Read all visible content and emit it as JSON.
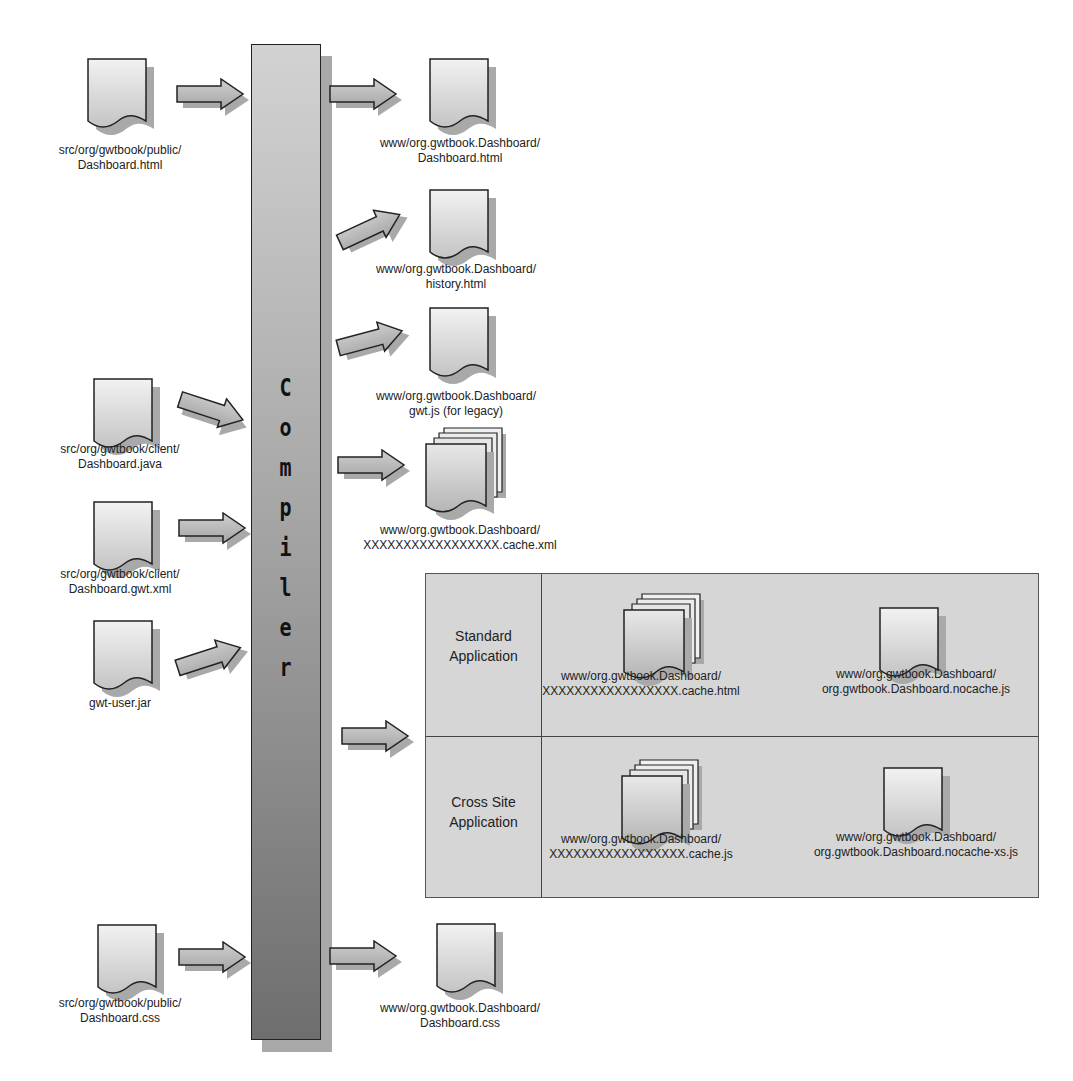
{
  "compiler": {
    "label": "Compiler",
    "letters": [
      "C",
      "o",
      "m",
      "p",
      "i",
      "l",
      "e",
      "r"
    ]
  },
  "inputs": [
    {
      "line1": "src/org/gwtbook/public/",
      "line2": "Dashboard.html"
    },
    {
      "line1": "src/org/gwtbook/client/",
      "line2": "Dashboard.java"
    },
    {
      "line1": "src/org/gwtbook/client/",
      "line2": "Dashboard.gwt.xml"
    },
    {
      "line1": "gwt-user.jar",
      "line2": ""
    },
    {
      "line1": "src/org/gwtbook/public/",
      "line2": "Dashboard.css"
    }
  ],
  "outputs": [
    {
      "line1": "www/org.gwtbook.Dashboard/",
      "line2": "Dashboard.html"
    },
    {
      "line1": "www/org.gwtbook.Dashboard/",
      "line2": "history.html"
    },
    {
      "line1": "www/org.gwtbook.Dashboard/",
      "line2": "gwt.js (for legacy)"
    },
    {
      "line1": "www/org.gwtbook.Dashboard/",
      "line2": "XXXXXXXXXXXXXXXXX.cache.xml"
    },
    {
      "line1": "www/org.gwtbook.Dashboard/",
      "line2": "Dashboard.css"
    }
  ],
  "panel": {
    "rows": [
      {
        "label_line1": "Standard",
        "label_line2": "Application",
        "files": [
          {
            "line1": "www/org.gwtbook.Dashboard/",
            "line2": "XXXXXXXXXXXXXXXXX.cache.html"
          },
          {
            "line1": "www/org.gwtbook.Dashboard/",
            "line2": "org.gwtbook.Dashboard.nocache.js"
          }
        ]
      },
      {
        "label_line1": "Cross Site",
        "label_line2": "Application",
        "files": [
          {
            "line1": "www/org.gwtbook.Dashboard/",
            "line2": "XXXXXXXXXXXXXXXXX.cache.js"
          },
          {
            "line1": "www/org.gwtbook.Dashboard/",
            "line2": "org.gwtbook.Dashboard.nocache-xs.js"
          }
        ]
      }
    ]
  },
  "colors": {
    "doc_fill_light": "#eeeeee",
    "doc_fill_dark": "#b9b9b9",
    "shadow": "#a9a9a9",
    "arrow_fill": "#b5b5b5",
    "stroke": "#222222",
    "panel_bg": "#d6d6d6"
  }
}
